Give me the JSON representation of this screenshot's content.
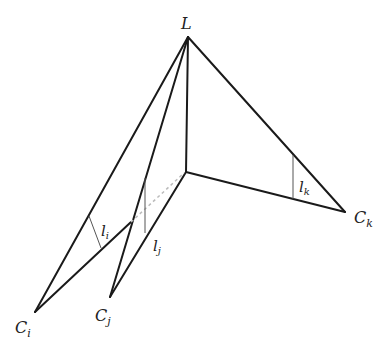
{
  "diagram": {
    "title": "",
    "labels": {
      "apex": "L",
      "ci_main": "C",
      "ci_sub": "i",
      "cj_main": "C",
      "cj_sub": "j",
      "ck_main": "C",
      "ck_sub": "k",
      "li_main": "l",
      "li_sub": "i",
      "lj_main": "l",
      "lj_sub": "j",
      "lk_main": "l",
      "lk_sub": "k"
    },
    "points": {
      "L": [
        188,
        37
      ],
      "O": [
        186,
        172
      ],
      "Ci": [
        35,
        312
      ],
      "Cj": [
        110,
        297
      ],
      "Ck": [
        345,
        212
      ],
      "X": [
        131,
        222
      ]
    }
  }
}
